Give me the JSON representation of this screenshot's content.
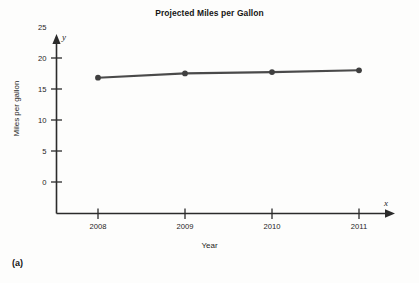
{
  "figure": {
    "caption": "(a)",
    "title": "Projected Miles per Gallon"
  },
  "axes": {
    "x_variable": "x",
    "y_variable": "y",
    "x_title": "Year",
    "y_title": "Miles per gallon",
    "x_ticks": [
      "2008",
      "2009",
      "2010",
      "2011"
    ],
    "y_ticks": [
      "0",
      "5",
      "10",
      "15",
      "20",
      "25"
    ]
  },
  "style": {
    "line_color": "#4a4a4a",
    "marker_color": "#3f3f3f",
    "axis_color": "#2b2b2b",
    "background": "#fdfdfc"
  },
  "chart_data": {
    "type": "line",
    "title": "Projected Miles per Gallon",
    "xlabel": "Year",
    "ylabel": "Miles per gallon",
    "categories": [
      "2008",
      "2009",
      "2010",
      "2011"
    ],
    "x": [
      2008,
      2009,
      2010,
      2011
    ],
    "values": [
      21.9,
      22.6,
      22.8,
      23.1
    ],
    "series": [
      {
        "name": "Projected miles per gallon",
        "values": [
          21.9,
          22.6,
          22.8,
          23.1
        ]
      }
    ],
    "xlim": [
      2007.4,
      2011.6
    ],
    "ylim": [
      0,
      27
    ],
    "ytick_values": [
      0,
      5,
      10,
      15,
      20,
      25
    ],
    "xtick_values": [
      2008,
      2009,
      2010,
      2011
    ],
    "grid": false,
    "legend": null,
    "markers": "filled-circle",
    "annotations": [
      "(a)"
    ]
  }
}
